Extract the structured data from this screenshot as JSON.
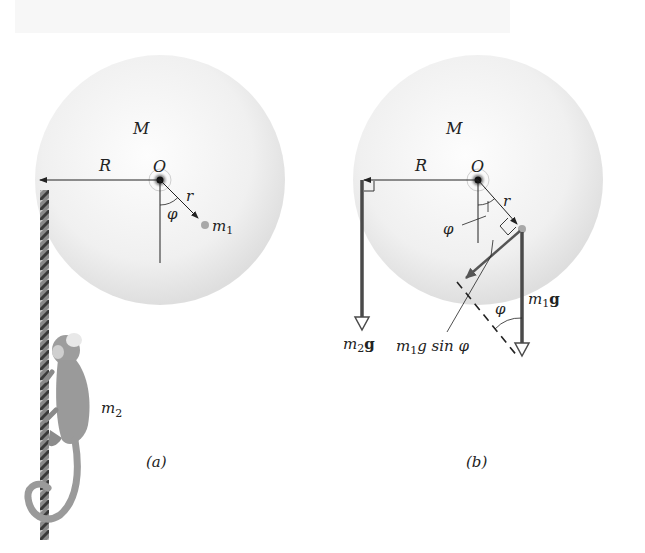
{
  "figure": {
    "panel_a": {
      "caption": "(a)",
      "disk_mass_label": "M",
      "center_label": "O",
      "radius_label": "R",
      "small_radius_label": "r",
      "angle_label": "φ",
      "particle_label": "m",
      "particle_sub": "1",
      "monkey_label": "m",
      "monkey_sub": "2"
    },
    "panel_b": {
      "caption": "(b)",
      "disk_mass_label": "M",
      "center_label": "O",
      "radius_label": "R",
      "small_radius_label": "r",
      "angle_label": "φ",
      "angle_label_2": "φ",
      "force_left_m": "m",
      "force_left_sub": "2",
      "force_left_g": "g",
      "force_right_m": "m",
      "force_right_sub": "1",
      "force_right_g": "g",
      "component_m": "m",
      "component_sub": "1",
      "component_rest": "g sin φ"
    },
    "colors": {
      "disk": "#e6e6e6",
      "disk_edge": "#d8d8d8",
      "force_arrow": "#4a4a4a",
      "particle": "#a0a0a0",
      "monkey": "#9a9a9a",
      "rope": "#6a6a6a"
    }
  }
}
